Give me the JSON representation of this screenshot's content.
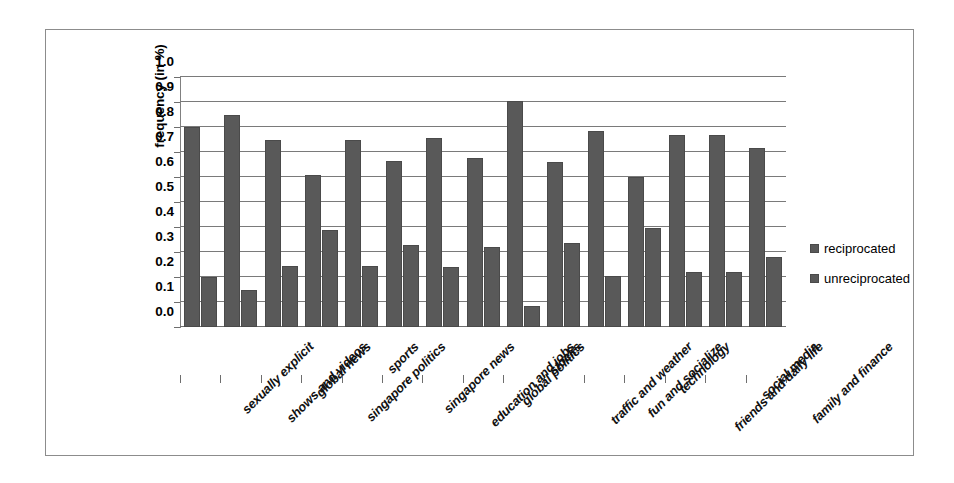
{
  "chart_data": {
    "type": "bar",
    "title": "",
    "xlabel": "",
    "ylabel": "frequency (in %)",
    "ylim": [
      0.0,
      1.0
    ],
    "ytick_labels": [
      "1.0",
      "0.9",
      "0.8",
      "0.7",
      "0.6",
      "0.5",
      "0.4",
      "0.3",
      "0.2",
      "0.1",
      "0.0"
    ],
    "ytick_values": [
      1.0,
      0.9,
      0.8,
      0.7,
      0.6,
      0.5,
      0.4,
      0.3,
      0.2,
      0.1,
      0.0
    ],
    "grid": "horizontal",
    "legend_position": "right",
    "categories": [
      "sexually explicit",
      "shows and videos",
      "global news",
      "singapore politics",
      "sports",
      "singapore news",
      "education and jobs",
      "global politics",
      "stocks",
      "traffic and weather",
      "fun and socialize",
      "technology",
      "friends and daily life",
      "social media",
      "family and finance"
    ],
    "series": [
      {
        "name": "reciprocated",
        "color": "#595959",
        "values": [
          0.8,
          0.85,
          0.75,
          0.61,
          0.75,
          0.665,
          0.755,
          0.675,
          0.905,
          0.66,
          0.785,
          0.6,
          0.77,
          0.77,
          0.715
        ]
      },
      {
        "name": "unreciprocated",
        "color": "#595959",
        "values": [
          0.2,
          0.15,
          0.245,
          0.39,
          0.245,
          0.33,
          0.24,
          0.32,
          0.085,
          0.335,
          0.205,
          0.395,
          0.22,
          0.22,
          0.28
        ]
      }
    ]
  },
  "legend": {
    "items": [
      {
        "label": "reciprocated",
        "swatch_color": "#595959"
      },
      {
        "label": "unreciprocated",
        "swatch_color": "#595959"
      }
    ]
  },
  "colors": {
    "bar_fill": "#595959",
    "bar_stroke": "#4a4a4a",
    "gridline": "#7a7a7a",
    "frame_border": "#8c8c8c",
    "axis": "#6e6e6e",
    "background": "#ffffff",
    "text": "#000000"
  }
}
